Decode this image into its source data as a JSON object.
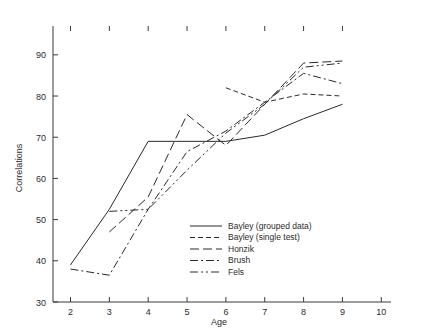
{
  "chart_data": {
    "type": "line",
    "title": "",
    "xlabel": "Age",
    "ylabel": "Correlations",
    "xlim": [
      1.55,
      10.25
    ],
    "ylim": [
      30,
      97
    ],
    "xticks": [
      2,
      3,
      4,
      5,
      6,
      7,
      8,
      9,
      10
    ],
    "yticks": [
      30,
      40,
      50,
      60,
      70,
      80,
      90
    ],
    "xtick_labels": [
      "2",
      "3",
      "4",
      "5",
      "6",
      "7",
      "8",
      "9",
      "10"
    ],
    "ytick_labels": [
      "30",
      "40",
      "50",
      "60",
      "70",
      "80",
      "90"
    ],
    "grid": false,
    "legend_position": "lower right",
    "line_color": "#2a2a2a",
    "axis_color": "#3a3a3a",
    "series": [
      {
        "name": "Bayley (grouped data)",
        "dash": "solid",
        "dasharray": "",
        "x": [
          2,
          3,
          4,
          5,
          6,
          7,
          8,
          9
        ],
        "y": [
          39,
          52.5,
          69,
          69,
          69,
          70.5,
          74.5,
          78
        ]
      },
      {
        "name": "Bayley (single test)",
        "dash": "dashed",
        "dasharray": "5,3",
        "x": [
          6,
          7,
          8,
          9
        ],
        "y": [
          82,
          78.5,
          80.5,
          80
        ]
      },
      {
        "name": "Honzik",
        "dash": "long-dash",
        "dasharray": "9,4",
        "x": [
          3,
          4,
          5,
          6,
          7,
          8,
          9
        ],
        "y": [
          47,
          55.5,
          75.5,
          68,
          78,
          88,
          88.5
        ]
      },
      {
        "name": "Brush",
        "dash": "dash-dot",
        "dasharray": "8,3,2,3",
        "x": [
          2,
          3,
          4,
          5,
          6,
          7,
          8,
          9
        ],
        "y": [
          38,
          36.5,
          52.5,
          66.5,
          71.5,
          78.5,
          85.5,
          83
        ]
      },
      {
        "name": "Fels",
        "dash": "dash-dot-dot",
        "dasharray": "8,3,2,3,2,3"
      }
    ],
    "fels_points": {
      "x": [
        3,
        4,
        5,
        6,
        7,
        8,
        9
      ],
      "y": [
        52,
        52.5,
        62,
        71,
        78,
        87,
        88
      ]
    },
    "legend_entries": [
      {
        "label": "Bayley (grouped data)",
        "dasharray": ""
      },
      {
        "label": "Bayley (single test)",
        "dasharray": "5,3"
      },
      {
        "label": "Honzik",
        "dasharray": "9,4"
      },
      {
        "label": "Brush",
        "dasharray": "8,3,2,3"
      },
      {
        "label": "Fels",
        "dasharray": "8,3,2,3,2,3"
      }
    ]
  },
  "labels": {
    "xlabel": "Age",
    "ylabel": "Correlations"
  }
}
